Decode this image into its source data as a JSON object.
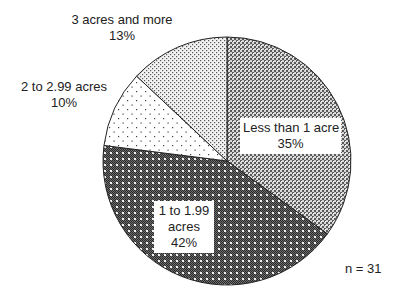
{
  "chart_data": {
    "type": "pie",
    "title": "",
    "start_angle_deg": 0,
    "direction": "clockwise",
    "slices": [
      {
        "label": "Less than 1 acre",
        "value": 35,
        "display": "35%",
        "pattern": "dense-crosshatch-light"
      },
      {
        "label": "1 to 1.99 acres",
        "label_lines": [
          "1 to 1.99",
          "acres"
        ],
        "value": 42,
        "display": "42%",
        "pattern": "dense-crosshatch-dark"
      },
      {
        "label": "2 to 2.99 acres",
        "value": 10,
        "display": "10%",
        "pattern": "sparse-dots"
      },
      {
        "label": "3 acres and more",
        "value": 13,
        "display": "13%",
        "pattern": "fine-dots"
      }
    ],
    "annotation": "n = 31",
    "legend": "none (labels placed on/near slices)"
  },
  "labels": {
    "less_than_1": {
      "line1": "Less than 1 acre",
      "line2": "35%"
    },
    "one_to_199": {
      "line1": "1 to 1.99",
      "line2": "acres",
      "line3": "42%"
    },
    "two_to_299": {
      "line1": "2 to 2.99 acres",
      "line2": "10%"
    },
    "three_plus": {
      "line1": "3 acres and more",
      "line2": "13%"
    }
  },
  "sample_size": "n = 31",
  "colors": {
    "outline": "#222222",
    "text": "#222222",
    "background": "#ffffff"
  }
}
